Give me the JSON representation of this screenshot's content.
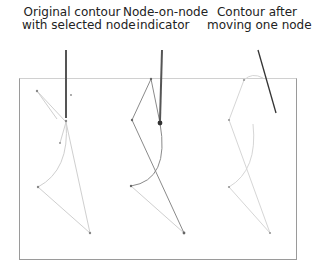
{
  "labels": {
    "left": [
      "Original contour",
      "with selected node"
    ],
    "middle": [
      "Node-on-node",
      "indicator"
    ],
    "right": [
      "Contour after",
      "moving one node"
    ]
  },
  "colors": {
    "contour_light": "#c8c8c8",
    "contour_dark": "#707070",
    "leader": "#333333",
    "frame": "#9a9a9a"
  },
  "panels": [
    {
      "name": "original",
      "description": "Original contour with selected node"
    },
    {
      "name": "node-on-node",
      "description": "Node-on-node indicator"
    },
    {
      "name": "moved",
      "description": "Contour after moving one node"
    }
  ]
}
